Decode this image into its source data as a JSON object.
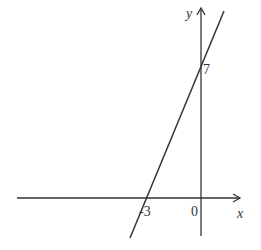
{
  "diagram": {
    "type": "coordinate-plane-line",
    "axes": {
      "x_label": "x",
      "y_label": "y",
      "origin_label": "0"
    },
    "line": {
      "x_intercept_label": "-3",
      "y_intercept_label": "7",
      "x_intercept": -3,
      "y_intercept": 7
    },
    "colors": {
      "stroke": "#333333",
      "background": "#ffffff"
    }
  }
}
